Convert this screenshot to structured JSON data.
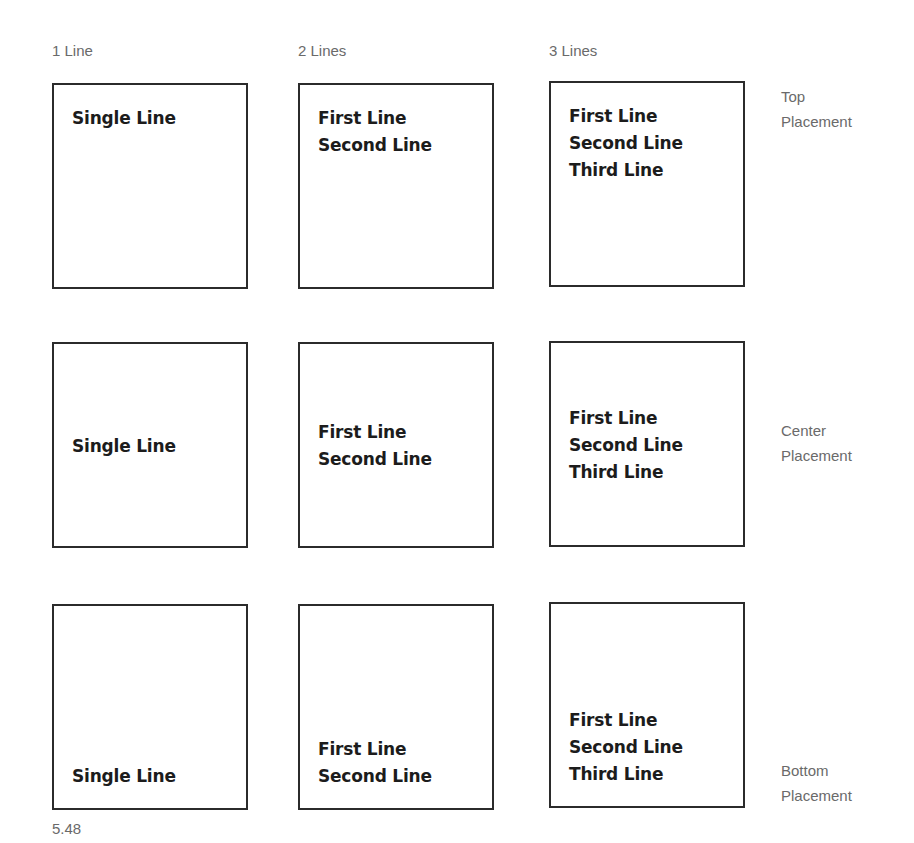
{
  "columns": [
    {
      "label": "1 Line"
    },
    {
      "label": "2 Lines"
    },
    {
      "label": "3 Lines"
    }
  ],
  "rows": [
    {
      "label_line1": "Top",
      "label_line2": "Placement",
      "placement": "top"
    },
    {
      "label_line1": "Center",
      "label_line2": "Placement",
      "placement": "center"
    },
    {
      "label_line1": "Bottom",
      "label_line2": "Placement",
      "placement": "bottom"
    }
  ],
  "boxes": {
    "one_line": [
      "Single Line"
    ],
    "two_lines": [
      "First Line",
      "Second Line"
    ],
    "three_lines": [
      "First Line",
      "Second Line",
      "Third Line"
    ]
  },
  "figure_number": "5.48"
}
